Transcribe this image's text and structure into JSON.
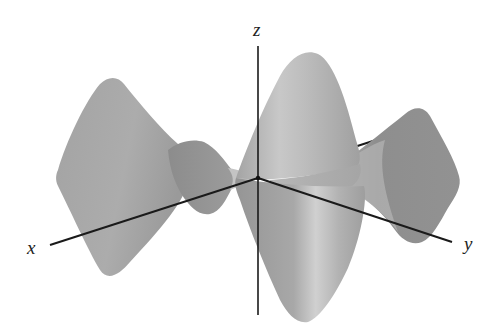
{
  "figure": {
    "type": "3d-surface-plot",
    "colors": {
      "background": "#ffffff",
      "axis": "#1a1a1a",
      "surface_dark": "#8f8f8f",
      "surface_mid": "#a9a9a9",
      "surface_light": "#cfcfcf",
      "label": "#222222"
    }
  },
  "axes": {
    "x": {
      "label": "x"
    },
    "y": {
      "label": "y"
    },
    "z": {
      "label": "z"
    }
  }
}
